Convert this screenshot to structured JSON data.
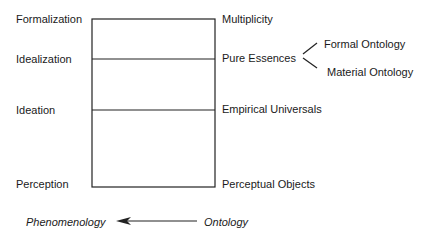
{
  "diagram": {
    "left_labels": [
      "Formalization",
      "Idealization",
      "Ideation",
      "Perception"
    ],
    "right_labels": [
      "Multiplicity",
      "Pure Essences",
      "Empirical Universals",
      "Perceptual Objects"
    ],
    "branch_labels": [
      "Formal Ontology",
      "Material Ontology"
    ],
    "arrow": {
      "from": "Ontology",
      "to": "Phenomenology"
    }
  }
}
